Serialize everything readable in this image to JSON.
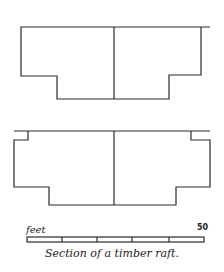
{
  "figure": {
    "caption": "Section of a timber raft.",
    "scale_bar": {
      "unit_label": "feet",
      "max_label": "50",
      "divisions": 5
    },
    "sections": [
      {
        "name": "upper-section",
        "description": "Stepped raft cross-section with central division"
      },
      {
        "name": "lower-section",
        "description": "Stepped raft cross-section with notched top corners and central division"
      }
    ],
    "colors": {
      "line": "#2a2a2a",
      "background": "#ffffff"
    }
  }
}
